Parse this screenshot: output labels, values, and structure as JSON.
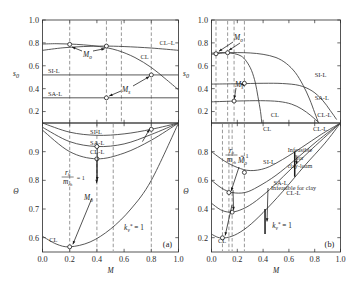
{
  "figure": {
    "panels": [
      {
        "tag": "(a)",
        "x_label": "M",
        "kv_annotation": "k",
        "kv_sub": "v",
        "kv_sup": "*",
        "kv_eq": "= 1"
      },
      {
        "tag": "(b)",
        "x_label": "M",
        "kv_annotation": "k",
        "kv_sub": "v",
        "kv_sup": "*",
        "kv_eq": "= 1"
      }
    ],
    "x_ticks": [
      "0.0",
      "0.2",
      "0.4",
      "0.6",
      "0.8",
      "1.0"
    ],
    "x_tick_values": [
      0.0,
      0.2,
      0.4,
      0.6,
      0.8,
      1.0
    ],
    "upper_y_label": "s",
    "upper_y_sub": "0",
    "lower_y_label": "Θ",
    "upper_y_ticks_a": [
      "1.0",
      "0.8",
      "0.6",
      "0.4",
      "0.2"
    ],
    "upper_y_tickvals_a": [
      1.0,
      0.8,
      0.6,
      0.4,
      0.2
    ],
    "lower_y_ticks_a": [
      "0.9",
      "0.8",
      "0.7",
      "0.6"
    ],
    "lower_y_tickvals_a": [
      0.9,
      0.8,
      0.7,
      0.6
    ],
    "upper_y_ticks_b": [
      "1.0",
      "0.8",
      "0.6",
      "0.4",
      "0.2"
    ],
    "upper_y_tickvals_b": [
      1.0,
      0.8,
      0.6,
      0.4,
      0.2
    ],
    "lower_y_ticks_b": [
      "0.8",
      "0.6",
      "0.4",
      "0.2"
    ],
    "lower_y_tickvals_b": [
      0.8,
      0.6,
      0.4,
      0.2
    ],
    "fraction": {
      "numerator": "r",
      "num_sub": "h",
      "denominator": "m",
      "den_sub": "r",
      "den_sub2": "h",
      "equals": "= 1"
    },
    "marker_labels": {
      "m_o": "M",
      "m_o_sub": "o",
      "m_s": "M",
      "m_s_sub": "s"
    },
    "infeasible_clay_loam": [
      "Infeasible",
      "for",
      "clay-loam"
    ],
    "infeasible_clay": "Infeasible for clay",
    "soil_labels": {
      "si_l": "SI-L",
      "sa_l": "SA-L",
      "cl_l": "CL–L",
      "cl": "CL",
      "cl_l2": "CL-L"
    }
  },
  "chart_data": {
    "type": "line",
    "title": "",
    "xlabel": "M",
    "panels": [
      {
        "tag": "(a)",
        "upper": {
          "ylabel": "s_0",
          "ylim": [
            0.1,
            1.0
          ],
          "xlim": [
            0.0,
            1.0
          ],
          "series": [
            {
              "name": "CL–L",
              "label_pos": [
                0.86,
                0.78
              ],
              "points": [
                [
                  0.0,
                  0.735
                ],
                [
                  0.15,
                  0.757
                ],
                [
                  0.3,
                  0.768
                ],
                [
                  0.45,
                  0.772
                ],
                [
                  0.6,
                  0.768
                ],
                [
                  0.8,
                  0.755
                ],
                [
                  1.0,
                  0.735
                ]
              ]
            },
            {
              "name": "CL",
              "label_pos": [
                0.72,
                0.655
              ],
              "points": [
                [
                  0.0,
                  0.79
                ],
                [
                  0.1,
                  0.793
                ],
                [
                  0.2,
                  0.79
                ],
                [
                  0.3,
                  0.783
                ],
                [
                  0.42,
                  0.768
                ],
                [
                  0.55,
                  0.735
                ],
                [
                  0.68,
                  0.672
                ],
                [
                  0.8,
                  0.585
                ],
                [
                  0.9,
                  0.49
                ],
                [
                  1.0,
                  0.39
                ]
              ]
            },
            {
              "name": "SI-L",
              "label_pos": [
                0.04,
                0.535
              ],
              "horizontal_at": 0.52
            },
            {
              "name": "SA-L",
              "label_pos": [
                0.04,
                0.335
              ],
              "horizontal_at": 0.32
            }
          ],
          "markers": [
            {
              "name": "M_o",
              "x": 0.2,
              "y": 0.787,
              "open": true
            },
            {
              "name": "M_o",
              "x": 0.47,
              "y": 0.772,
              "open": true
            },
            {
              "name": "M_s",
              "x": 0.47,
              "y": 0.32,
              "open": true
            },
            {
              "name": "M_s",
              "x": 0.8,
              "y": 0.52,
              "open": true
            }
          ],
          "vlines": [
            0.2,
            0.47,
            0.58,
            0.8
          ]
        },
        "lower": {
          "ylabel": "Θ",
          "ylim": [
            0.55,
            1.0
          ],
          "xlim": [
            0.0,
            1.0
          ],
          "series": [
            {
              "name": "SI-L",
              "label_pos": [
                0.35,
                0.962
              ],
              "points": [
                [
                  0.0,
                  1.0
                ],
                [
                  0.2,
                  0.968
                ],
                [
                  0.4,
                  0.957
                ],
                [
                  0.6,
                  0.962
                ],
                [
                  0.8,
                  0.978
                ],
                [
                  1.0,
                  1.0
                ]
              ]
            },
            {
              "name": "SA-L",
              "label_pos": [
                0.35,
                0.925
              ],
              "points": [
                [
                  0.0,
                  0.985
                ],
                [
                  0.2,
                  0.935
                ],
                [
                  0.4,
                  0.918
                ],
                [
                  0.6,
                  0.927
                ],
                [
                  0.8,
                  0.96
                ],
                [
                  1.0,
                  1.0
                ]
              ]
            },
            {
              "name": "CL-L",
              "label_pos": [
                0.35,
                0.893
              ],
              "points": [
                [
                  0.0,
                  0.975
                ],
                [
                  0.2,
                  0.9
                ],
                [
                  0.4,
                  0.875
                ],
                [
                  0.6,
                  0.895
                ],
                [
                  0.8,
                  0.94
                ],
                [
                  1.0,
                  1.0
                ]
              ]
            },
            {
              "name": "CL",
              "label_pos": [
                0.05,
                0.585
              ],
              "points": [
                [
                  0.0,
                  0.605
                ],
                [
                  0.1,
                  0.578
                ],
                [
                  0.2,
                  0.568
                ],
                [
                  0.35,
                  0.585
                ],
                [
                  0.5,
                  0.63
                ],
                [
                  0.65,
                  0.7
                ],
                [
                  0.8,
                  0.8
                ],
                [
                  1.0,
                  1.0
                ]
              ]
            }
          ],
          "markers": [
            {
              "name": "M_o",
              "x": 0.2,
              "y": 0.568,
              "open": true
            },
            {
              "name": "M_s",
              "x": 0.4,
              "y": 0.875,
              "open": true
            },
            {
              "name": "M_s",
              "x": 0.4,
              "y": 0.918,
              "open": true
            },
            {
              "name": "M_s",
              "x": 0.8,
              "y": 0.978,
              "open": true
            }
          ],
          "vlines": [
            0.2,
            0.4,
            0.52,
            0.8
          ]
        }
      },
      {
        "tag": "(b)",
        "upper": {
          "ylabel": "s_0",
          "ylim": [
            0.1,
            1.0
          ],
          "xlim": [
            0.0,
            1.0
          ],
          "series": [
            {
              "name": "SI-L",
              "label_pos": [
                0.8,
                0.5
              ],
              "points": [
                [
                  0.0,
                  0.44
                ],
                [
                  0.2,
                  0.443
                ],
                [
                  0.4,
                  0.447
                ],
                [
                  0.55,
                  0.445
                ],
                [
                  0.68,
                  0.428
                ],
                [
                  0.78,
                  0.38
                ],
                [
                  0.86,
                  0.3
                ],
                [
                  0.92,
                  0.21
                ],
                [
                  0.97,
                  0.13
                ]
              ]
            },
            {
              "name": "SA-L",
              "label_pos": [
                0.8,
                0.305
              ],
              "points": [
                [
                  0.0,
                  0.285
                ],
                [
                  0.2,
                  0.292
                ],
                [
                  0.38,
                  0.295
                ],
                [
                  0.52,
                  0.288
                ],
                [
                  0.62,
                  0.265
                ],
                [
                  0.7,
                  0.222
                ],
                [
                  0.77,
                  0.165
                ],
                [
                  0.83,
                  0.105
                ]
              ]
            },
            {
              "name": "CL-L",
              "label_pos": [
                0.82,
                0.155
              ],
              "points": [
                [
                  0.0,
                  0.7
                ],
                [
                  0.1,
                  0.712
                ],
                [
                  0.2,
                  0.715
                ],
                [
                  0.3,
                  0.712
                ],
                [
                  0.4,
                  0.7
                ],
                [
                  0.5,
                  0.672
                ],
                [
                  0.58,
                  0.62
                ],
                [
                  0.65,
                  0.54
                ],
                [
                  0.71,
                  0.43
                ],
                [
                  0.76,
                  0.31
                ],
                [
                  0.8,
                  0.19
                ],
                [
                  0.83,
                  0.1
                ]
              ]
            },
            {
              "name": "CL",
              "label_pos": [
                0.46,
                0.155
              ],
              "points": [
                [
                  0.0,
                  0.71
                ],
                [
                  0.06,
                  0.715
                ],
                [
                  0.12,
                  0.714
                ],
                [
                  0.18,
                  0.705
                ],
                [
                  0.23,
                  0.685
                ],
                [
                  0.27,
                  0.64
                ],
                [
                  0.31,
                  0.56
                ],
                [
                  0.34,
                  0.45
                ],
                [
                  0.36,
                  0.33
                ],
                [
                  0.38,
                  0.2
                ],
                [
                  0.39,
                  0.1
                ]
              ]
            }
          ],
          "markers": [
            {
              "name": "M_o",
              "x": 0.035,
              "y": 0.705,
              "open": true
            },
            {
              "name": "M_o",
              "x": 0.125,
              "y": 0.714,
              "open": true
            },
            {
              "name": "M_s",
              "x": 0.255,
              "y": 0.447,
              "open": true
            },
            {
              "name": "M_s",
              "x": 0.175,
              "y": 0.292,
              "open": true
            }
          ],
          "vlines": [
            0.035,
            0.125,
            0.175,
            0.255
          ]
        },
        "lower": {
          "ylabel": "Θ",
          "ylim": [
            0.1,
            1.0
          ],
          "xlim": [
            0.0,
            1.0
          ],
          "series": [
            {
              "name": "SI-L",
              "label_pos": [
                0.4,
                0.715
              ],
              "points": [
                [
                  0.0,
                  0.8
                ],
                [
                  0.1,
                  0.735
                ],
                [
                  0.2,
                  0.69
                ],
                [
                  0.3,
                  0.668
                ],
                [
                  0.42,
                  0.685
                ],
                [
                  0.55,
                  0.745
                ],
                [
                  0.7,
                  0.83
                ],
                [
                  0.85,
                  0.92
                ],
                [
                  1.0,
                  1.0
                ]
              ]
            },
            {
              "name": "SA-L",
              "label_pos": [
                0.48,
                0.565
              ],
              "points": [
                [
                  0.0,
                  0.6
                ],
                [
                  0.08,
                  0.545
                ],
                [
                  0.16,
                  0.515
                ],
                [
                  0.26,
                  0.515
                ],
                [
                  0.36,
                  0.555
                ],
                [
                  0.5,
                  0.635
                ],
                [
                  0.65,
                  0.745
                ],
                [
                  0.82,
                  0.875
                ],
                [
                  1.0,
                  1.0
                ]
              ]
            },
            {
              "name": "CL-L",
              "label_pos": [
                0.58,
                0.5
              ],
              "points": [
                [
                  0.0,
                  0.44
                ],
                [
                  0.07,
                  0.395
                ],
                [
                  0.14,
                  0.378
                ],
                [
                  0.22,
                  0.392
                ],
                [
                  0.32,
                  0.44
                ],
                [
                  0.45,
                  0.535
                ],
                [
                  0.6,
                  0.665
                ],
                [
                  0.78,
                  0.82
                ],
                [
                  1.0,
                  1.0
                ]
              ]
            },
            {
              "name": "CL",
              "label_pos": [
                0.05,
                0.16
              ],
              "points": [
                [
                  0.0,
                  0.225
                ],
                [
                  0.05,
                  0.202
                ],
                [
                  0.1,
                  0.198
                ],
                [
                  0.18,
                  0.218
                ],
                [
                  0.28,
                  0.275
                ],
                [
                  0.4,
                  0.375
                ],
                [
                  0.55,
                  0.52
                ],
                [
                  0.72,
                  0.7
                ],
                [
                  0.88,
                  0.86
                ],
                [
                  1.0,
                  1.0
                ]
              ]
            }
          ],
          "markers": [
            {
              "name": "M_o",
              "x": 0.085,
              "y": 0.199,
              "open": true
            },
            {
              "name": "M_o",
              "x": 0.135,
              "y": 0.515,
              "open": true
            },
            {
              "name": "M_s",
              "x": 0.255,
              "y": 0.655,
              "open": true
            },
            {
              "name": "M_s",
              "x": 0.16,
              "y": 0.378,
              "open": true
            }
          ],
          "vlines": [
            0.085,
            0.135,
            0.16,
            0.255
          ]
        }
      }
    ]
  }
}
